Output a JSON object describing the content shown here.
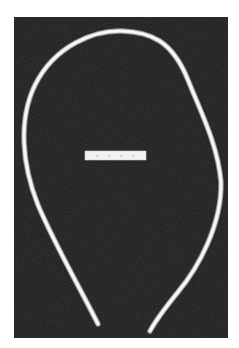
{
  "image": {
    "subject": "curved-tube-on-dark-background",
    "background_color": "#1c1c1c",
    "page_color": "#ffffff",
    "object_color": "#e6e6e6",
    "object_shadow_color": "#9a9a9a",
    "scale_bar": {
      "color": "#f2f2f2",
      "tick_color": "#9a9a9a",
      "ticks": 4
    }
  },
  "caption": "Curved tube with scale bar"
}
